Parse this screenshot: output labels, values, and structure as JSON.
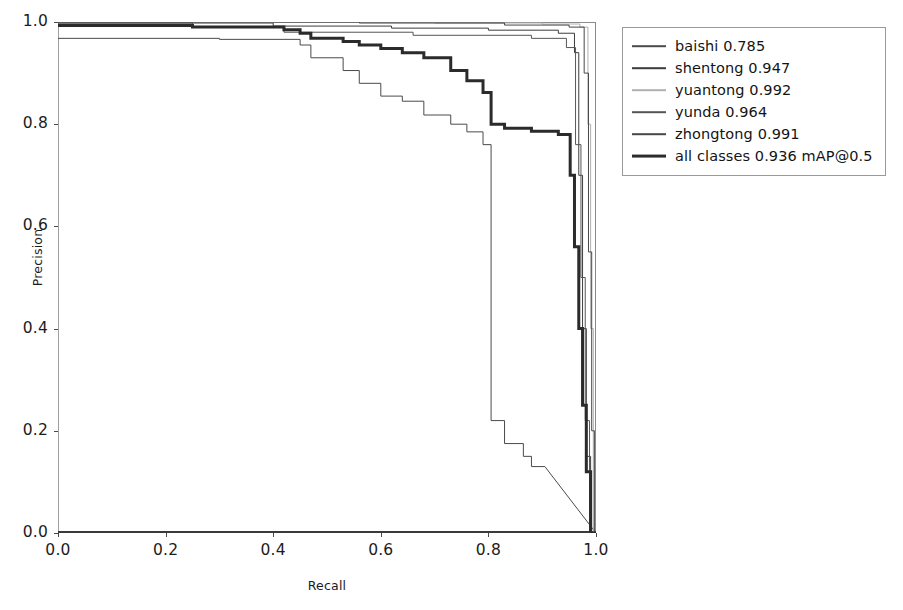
{
  "chart_data": {
    "type": "line",
    "title": "",
    "xlabel": "Recall",
    "ylabel": "Precision",
    "xlim": [
      0.0,
      1.0
    ],
    "ylim": [
      0.0,
      1.0
    ],
    "xticks": [
      "0.0",
      "0.2",
      "0.4",
      "0.6",
      "0.8",
      "1.0"
    ],
    "yticks": [
      "0.0",
      "0.2",
      "0.4",
      "0.6",
      "0.8",
      "1.0"
    ],
    "xtick_values": [
      0.0,
      0.2,
      0.4,
      0.6,
      0.8,
      1.0
    ],
    "ytick_values": [
      0.0,
      0.2,
      0.4,
      0.6,
      0.8,
      1.0
    ],
    "grid": false,
    "legend_position": "outside right upper",
    "metric": "mAP@0.5",
    "series": [
      {
        "name": "baishi",
        "score": "0.785",
        "legend_label": "baishi 0.785",
        "color": "#4a4a4a",
        "linewidth": 1.0,
        "points": [
          [
            0.0,
            0.968
          ],
          [
            0.3,
            0.968
          ],
          [
            0.3,
            0.966
          ],
          [
            0.45,
            0.966
          ],
          [
            0.45,
            0.955
          ],
          [
            0.47,
            0.955
          ],
          [
            0.47,
            0.93
          ],
          [
            0.53,
            0.93
          ],
          [
            0.53,
            0.905
          ],
          [
            0.56,
            0.905
          ],
          [
            0.56,
            0.88
          ],
          [
            0.6,
            0.88
          ],
          [
            0.6,
            0.855
          ],
          [
            0.64,
            0.855
          ],
          [
            0.64,
            0.845
          ],
          [
            0.68,
            0.845
          ],
          [
            0.68,
            0.818
          ],
          [
            0.73,
            0.818
          ],
          [
            0.73,
            0.8
          ],
          [
            0.76,
            0.8
          ],
          [
            0.76,
            0.785
          ],
          [
            0.79,
            0.785
          ],
          [
            0.79,
            0.76
          ],
          [
            0.805,
            0.76
          ],
          [
            0.805,
            0.22
          ],
          [
            0.83,
            0.22
          ],
          [
            0.83,
            0.175
          ],
          [
            0.865,
            0.175
          ],
          [
            0.865,
            0.15
          ],
          [
            0.88,
            0.15
          ],
          [
            0.88,
            0.13
          ],
          [
            0.905,
            0.13
          ],
          [
            1.0,
            0.0
          ]
        ]
      },
      {
        "name": "shentong",
        "score": "0.947",
        "legend_label": "shentong 0.947",
        "color": "#3c3c3c",
        "linewidth": 1.0,
        "points": [
          [
            0.0,
            0.998
          ],
          [
            0.4,
            0.998
          ],
          [
            0.4,
            0.992
          ],
          [
            0.62,
            0.992
          ],
          [
            0.62,
            0.988
          ],
          [
            0.8,
            0.988
          ],
          [
            0.8,
            0.984
          ],
          [
            0.93,
            0.984
          ],
          [
            0.93,
            0.978
          ],
          [
            0.96,
            0.978
          ],
          [
            0.96,
            0.94
          ],
          [
            0.968,
            0.94
          ],
          [
            0.968,
            0.7
          ],
          [
            0.975,
            0.7
          ],
          [
            0.975,
            0.4
          ],
          [
            0.982,
            0.4
          ],
          [
            0.982,
            0.15
          ],
          [
            0.99,
            0.15
          ],
          [
            0.99,
            0.0
          ],
          [
            1.0,
            0.0
          ]
        ]
      },
      {
        "name": "yuantong",
        "score": "0.992",
        "legend_label": "yuantong 0.992",
        "color": "#b0b0b0",
        "linewidth": 1.0,
        "points": [
          [
            0.0,
            1.0
          ],
          [
            0.7,
            1.0
          ],
          [
            0.7,
            0.998
          ],
          [
            0.9,
            0.998
          ],
          [
            0.9,
            0.996
          ],
          [
            0.97,
            0.996
          ],
          [
            0.97,
            0.99
          ],
          [
            0.985,
            0.99
          ],
          [
            0.985,
            0.8
          ],
          [
            0.99,
            0.8
          ],
          [
            0.99,
            0.4
          ],
          [
            0.995,
            0.4
          ],
          [
            0.995,
            0.0
          ],
          [
            1.0,
            0.0
          ]
        ]
      },
      {
        "name": "yunda",
        "score": "0.964",
        "legend_label": "yunda 0.964",
        "color": "#555555",
        "linewidth": 1.0,
        "points": [
          [
            0.0,
            0.998
          ],
          [
            0.25,
            0.998
          ],
          [
            0.25,
            0.99
          ],
          [
            0.42,
            0.99
          ],
          [
            0.42,
            0.98
          ],
          [
            0.66,
            0.98
          ],
          [
            0.66,
            0.974
          ],
          [
            0.88,
            0.974
          ],
          [
            0.88,
            0.968
          ],
          [
            0.945,
            0.968
          ],
          [
            0.945,
            0.95
          ],
          [
            0.962,
            0.95
          ],
          [
            0.962,
            0.76
          ],
          [
            0.972,
            0.76
          ],
          [
            0.972,
            0.5
          ],
          [
            0.98,
            0.5
          ],
          [
            0.98,
            0.22
          ],
          [
            0.988,
            0.22
          ],
          [
            0.988,
            0.0
          ],
          [
            1.0,
            0.0
          ]
        ]
      },
      {
        "name": "zhongtong",
        "score": "0.991",
        "legend_label": "zhongtong 0.991",
        "color": "#474747",
        "linewidth": 1.0,
        "points": [
          [
            0.0,
            1.0
          ],
          [
            0.56,
            1.0
          ],
          [
            0.56,
            0.998
          ],
          [
            0.83,
            0.998
          ],
          [
            0.83,
            0.994
          ],
          [
            0.95,
            0.994
          ],
          [
            0.95,
            0.99
          ],
          [
            0.978,
            0.99
          ],
          [
            0.978,
            0.9
          ],
          [
            0.986,
            0.9
          ],
          [
            0.986,
            0.55
          ],
          [
            0.992,
            0.55
          ],
          [
            0.992,
            0.2
          ],
          [
            0.997,
            0.2
          ],
          [
            0.997,
            0.0
          ],
          [
            1.0,
            0.0
          ]
        ]
      },
      {
        "name": "all classes",
        "score": "0.936",
        "legend_label": "all classes 0.936 mAP@0.5",
        "color": "#2b2b2b",
        "linewidth": 3.0,
        "points": [
          [
            0.0,
            0.993
          ],
          [
            0.25,
            0.993
          ],
          [
            0.25,
            0.99
          ],
          [
            0.42,
            0.99
          ],
          [
            0.42,
            0.985
          ],
          [
            0.45,
            0.985
          ],
          [
            0.45,
            0.978
          ],
          [
            0.47,
            0.978
          ],
          [
            0.47,
            0.968
          ],
          [
            0.53,
            0.968
          ],
          [
            0.53,
            0.962
          ],
          [
            0.56,
            0.962
          ],
          [
            0.56,
            0.955
          ],
          [
            0.6,
            0.955
          ],
          [
            0.6,
            0.948
          ],
          [
            0.64,
            0.948
          ],
          [
            0.64,
            0.94
          ],
          [
            0.68,
            0.94
          ],
          [
            0.68,
            0.93
          ],
          [
            0.73,
            0.93
          ],
          [
            0.73,
            0.905
          ],
          [
            0.76,
            0.905
          ],
          [
            0.76,
            0.885
          ],
          [
            0.79,
            0.885
          ],
          [
            0.79,
            0.862
          ],
          [
            0.805,
            0.862
          ],
          [
            0.805,
            0.8
          ],
          [
            0.83,
            0.8
          ],
          [
            0.83,
            0.792
          ],
          [
            0.88,
            0.792
          ],
          [
            0.88,
            0.786
          ],
          [
            0.93,
            0.786
          ],
          [
            0.93,
            0.78
          ],
          [
            0.952,
            0.78
          ],
          [
            0.952,
            0.7
          ],
          [
            0.96,
            0.7
          ],
          [
            0.96,
            0.56
          ],
          [
            0.968,
            0.56
          ],
          [
            0.968,
            0.4
          ],
          [
            0.975,
            0.4
          ],
          [
            0.975,
            0.25
          ],
          [
            0.982,
            0.25
          ],
          [
            0.982,
            0.12
          ],
          [
            0.99,
            0.12
          ],
          [
            0.99,
            0.0
          ],
          [
            1.0,
            0.0
          ]
        ]
      }
    ]
  }
}
